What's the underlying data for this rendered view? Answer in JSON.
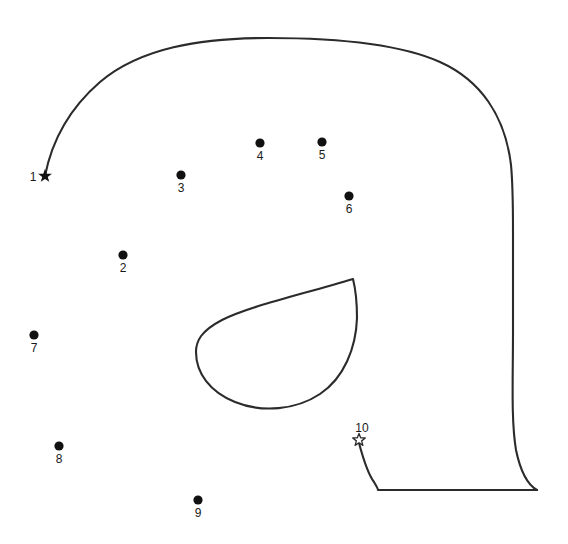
{
  "page": {
    "background_color": "#ffffff",
    "line_color": "#2b2b2b",
    "dot_color": "#111111",
    "width": 568,
    "height": 544
  },
  "puzzle": {
    "type": "connect-the-dots",
    "subject": "elephant head outline",
    "start_marker": "filled-star",
    "end_marker": "hollow-star",
    "points": [
      {
        "number": "1",
        "x": 45,
        "y": 176,
        "marker": "filled-star",
        "label_x": 33,
        "label_y": 181
      },
      {
        "number": "2",
        "x": 123,
        "y": 255,
        "marker": "dot",
        "label_x": 123,
        "label_y": 272
      },
      {
        "number": "3",
        "x": 181,
        "y": 175,
        "marker": "dot",
        "label_x": 181,
        "label_y": 192
      },
      {
        "number": "4",
        "x": 260,
        "y": 143,
        "marker": "dot",
        "label_x": 260,
        "label_y": 160
      },
      {
        "number": "5",
        "x": 322,
        "y": 142,
        "marker": "dot",
        "label_x": 322,
        "label_y": 159
      },
      {
        "number": "6",
        "x": 349,
        "y": 196,
        "marker": "dot",
        "label_x": 349,
        "label_y": 213
      },
      {
        "number": "7",
        "x": 34,
        "y": 335,
        "marker": "dot",
        "label_x": 34,
        "label_y": 352
      },
      {
        "number": "8",
        "x": 59,
        "y": 446,
        "marker": "dot",
        "label_x": 59,
        "label_y": 463
      },
      {
        "number": "9",
        "x": 198,
        "y": 500,
        "marker": "dot",
        "label_x": 198,
        "label_y": 517
      },
      {
        "number": "10",
        "x": 359,
        "y": 440,
        "marker": "hollow-star",
        "label_x": 362,
        "label_y": 432
      }
    ],
    "strokes": [
      {
        "name": "head-and-back-outline",
        "d": "M 45 176 C 52 140 70 108 100 82 C 140 48 200 38 268 38 C 340 38 400 44 440 62 C 480 80 505 115 511 165 C 513 186 513 205 513 232 L 513 330 C 513 380 511 420 516 450 C 521 474 528 485 537 490"
      },
      {
        "name": "trunk-leg-outline",
        "d": "M 359 443 C 363 458 368 474 374 482 C 377 487 378 489 378 490 L 537 490"
      },
      {
        "name": "ear-teardrop",
        "d": "M 353 279 C 300 295 250 306 222 320 C 201 331 196 341 196 352 C 196 373 210 392 235 402 C 262 413 296 410 320 394 C 344 378 356 348 357 318 C 357 300 355 287 353 279 Z"
      }
    ]
  }
}
